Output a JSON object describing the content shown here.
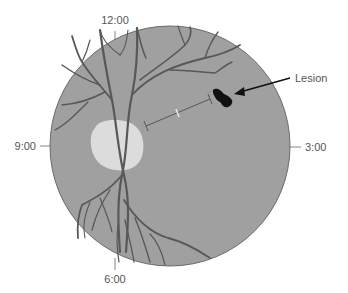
{
  "diagram": {
    "type": "fundus-clock-diagram",
    "clock_labels": {
      "top": "12:00",
      "right": "3:00",
      "bottom": "6:00",
      "left": "9:00"
    },
    "annotation": {
      "label": "Lesion"
    },
    "colors": {
      "fundus": "#a0a0a0",
      "fundus_border": "#6a6a6a",
      "vessels": "#585858",
      "optic_disc": "#dcdcdc",
      "lesion": "#111111",
      "arrow": "#111111",
      "label_text": "#555555",
      "tick": "#666666"
    }
  }
}
